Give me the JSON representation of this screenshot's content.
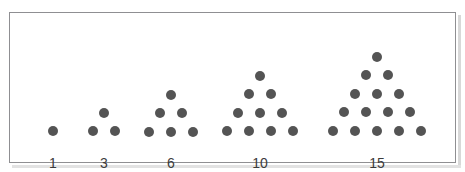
{
  "figure": {
    "kind": "triangular-number-dot-diagram",
    "background_color": "#ffffff",
    "border_color": "#8f8f92",
    "dot_color": "#545454",
    "label_color": "#3b3b3b",
    "dot_diameter_px": 10,
    "groups": [
      {
        "label": "1",
        "rows": 1,
        "dot_count": 1,
        "apex_cx": 43,
        "apex_cy": 118,
        "label_x": 43,
        "label_y": 143
      },
      {
        "label": "3",
        "rows": 2,
        "dot_count": 3,
        "apex_cx": 94,
        "apex_cy": 100,
        "label_x": 94,
        "label_y": 143
      },
      {
        "label": "6",
        "rows": 3,
        "dot_count": 6,
        "apex_cx": 161,
        "apex_cy": 82,
        "label_x": 161,
        "label_y": 143
      },
      {
        "label": "10",
        "rows": 4,
        "dot_count": 10,
        "apex_cx": 250,
        "apex_cy": 63,
        "label_x": 250,
        "label_y": 143
      },
      {
        "label": "15",
        "rows": 5,
        "dot_count": 15,
        "apex_cx": 367,
        "apex_cy": 44,
        "label_x": 367,
        "label_y": 143
      }
    ],
    "row_spacing_px": 18.4,
    "column_spacing_px": 21.8
  },
  "chart_data": {
    "type": "scatter",
    "title": "",
    "subtitle": "",
    "xlabel": "",
    "ylabel": "",
    "categories": [
      "1",
      "3",
      "6",
      "10",
      "15"
    ],
    "values": [
      1,
      3,
      6,
      10,
      15
    ],
    "series": [
      {
        "name": "rows per triangle",
        "values": [
          1,
          2,
          3,
          4,
          5
        ]
      },
      {
        "name": "dots per triangle",
        "values": [
          1,
          3,
          6,
          10,
          15
        ]
      }
    ],
    "row_counts": [
      [
        1
      ],
      [
        1,
        2
      ],
      [
        1,
        2,
        3
      ],
      [
        1,
        2,
        3,
        4
      ],
      [
        1,
        2,
        3,
        4,
        5
      ]
    ],
    "tick_labels": [
      "1",
      "3",
      "6",
      "10",
      "15"
    ],
    "grid": false,
    "legend": "none"
  }
}
